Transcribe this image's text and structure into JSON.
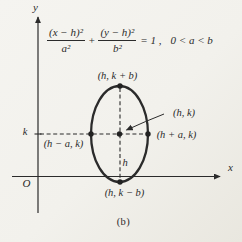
{
  "figure": {
    "caption": "(b)",
    "background_color": "#f2f1ec",
    "ink_color": "#2b2b2b"
  },
  "equation": {
    "numerator_x": "(x − h)²",
    "denominator_x": "a²",
    "plus_sign": "+",
    "numerator_y": "(y − h)²",
    "denominator_y": "b²",
    "equals_one": "= 1 ,",
    "constraint": "0 < a < b"
  },
  "axes": {
    "x_axis_label": "x",
    "y_axis_label": "y",
    "origin_label": "O",
    "k_label": "k",
    "h_label": "h"
  },
  "point_labels": {
    "top_vertex": "(h, k + b)",
    "center": "(h, k)",
    "right_vertex": "(h + a, k)",
    "left_vertex": "(h − a, k)",
    "bottom_vertex": "(h, k − b)"
  }
}
